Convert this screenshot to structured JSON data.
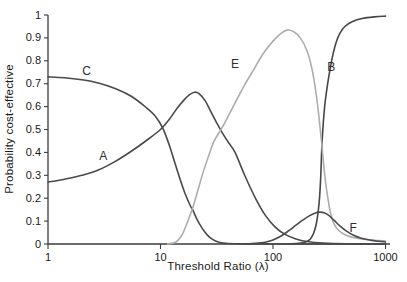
{
  "figure": {
    "background": "#ffffff",
    "axis_color": "#3d3d3d",
    "text_color": "#1a1a1a",
    "dark_curve_color": "#4a4a4a",
    "light_curve_color": "#adadad"
  },
  "chart_data": {
    "type": "line",
    "title": "",
    "xlabel": "Threshold Ratio (λ)",
    "ylabel": "Probability cost-effective",
    "x_scale": "log",
    "xlim": [
      1,
      1000
    ],
    "ylim": [
      0,
      1
    ],
    "grid": false,
    "legend": "inline letter labels on curves",
    "x_ticks": [
      {
        "value": 1,
        "label": "1"
      },
      {
        "value": 10,
        "label": "10"
      },
      {
        "value": 100,
        "label": "100"
      },
      {
        "value": 1000,
        "label": "1000"
      }
    ],
    "y_ticks": [
      {
        "value": 0.0,
        "label": "0"
      },
      {
        "value": 0.1,
        "label": "0.1"
      },
      {
        "value": 0.2,
        "label": "0.2"
      },
      {
        "value": 0.3,
        "label": "0.3"
      },
      {
        "value": 0.4,
        "label": "0.4"
      },
      {
        "value": 0.5,
        "label": "0.5"
      },
      {
        "value": 0.6,
        "label": "0.6"
      },
      {
        "value": 0.7,
        "label": "0.7"
      },
      {
        "value": 0.8,
        "label": "0.8"
      },
      {
        "value": 0.9,
        "label": "0.9"
      },
      {
        "value": 1.0,
        "label": "1"
      }
    ],
    "series": [
      {
        "name": "A",
        "color": "#4a4a4a",
        "label": "A",
        "label_pos": {
          "x": 3.1,
          "y": 0.385
        },
        "points": [
          [
            1,
            0.27
          ],
          [
            1.4,
            0.283
          ],
          [
            2,
            0.3
          ],
          [
            2.8,
            0.323
          ],
          [
            4,
            0.362
          ],
          [
            5.5,
            0.405
          ],
          [
            7.5,
            0.452
          ],
          [
            10,
            0.5
          ],
          [
            12,
            0.545
          ],
          [
            14,
            0.592
          ],
          [
            16,
            0.626
          ],
          [
            18,
            0.651
          ],
          [
            20,
            0.663
          ],
          [
            22,
            0.657
          ],
          [
            25,
            0.625
          ],
          [
            28,
            0.578
          ],
          [
            31.5,
            0.53
          ],
          [
            35,
            0.49
          ],
          [
            40,
            0.445
          ],
          [
            46,
            0.4
          ],
          [
            56,
            0.3
          ],
          [
            69,
            0.205
          ],
          [
            85,
            0.127
          ],
          [
            104,
            0.075
          ],
          [
            128,
            0.042
          ],
          [
            160,
            0.022
          ],
          [
            200,
            0.011
          ],
          [
            280,
            0.004
          ],
          [
            450,
            0.001
          ],
          [
            1000,
            0.0005
          ]
        ]
      },
      {
        "name": "B",
        "color": "#464646",
        "label": "B",
        "label_pos": {
          "x": 330,
          "y": 0.775
        },
        "points": [
          [
            140,
            0.0005
          ],
          [
            170,
            0.003
          ],
          [
            195,
            0.009
          ],
          [
            215,
            0.022
          ],
          [
            230,
            0.048
          ],
          [
            242,
            0.085
          ],
          [
            252,
            0.14
          ],
          [
            260,
            0.21
          ],
          [
            266,
            0.3
          ],
          [
            272,
            0.43
          ],
          [
            280,
            0.53
          ],
          [
            290,
            0.615
          ],
          [
            305,
            0.695
          ],
          [
            322,
            0.765
          ],
          [
            342,
            0.83
          ],
          [
            365,
            0.882
          ],
          [
            395,
            0.922
          ],
          [
            440,
            0.952
          ],
          [
            510,
            0.972
          ],
          [
            620,
            0.985
          ],
          [
            800,
            0.992
          ],
          [
            1000,
            0.995
          ]
        ]
      },
      {
        "name": "C",
        "color": "#4a4a4a",
        "label": "C",
        "label_pos": {
          "x": 2.2,
          "y": 0.757
        },
        "points": [
          [
            1,
            0.73
          ],
          [
            1.4,
            0.726
          ],
          [
            2,
            0.717
          ],
          [
            2.8,
            0.703
          ],
          [
            4,
            0.678
          ],
          [
            5.5,
            0.645
          ],
          [
            7.5,
            0.595
          ],
          [
            9,
            0.558
          ],
          [
            10.5,
            0.505
          ],
          [
            12,
            0.43
          ],
          [
            13.5,
            0.35
          ],
          [
            15,
            0.28
          ],
          [
            16.7,
            0.215
          ],
          [
            18.5,
            0.165
          ],
          [
            19.4,
            0.148
          ],
          [
            21,
            0.11
          ],
          [
            23.5,
            0.068
          ],
          [
            26,
            0.04
          ],
          [
            29,
            0.02
          ],
          [
            33,
            0.008
          ],
          [
            40,
            0.002
          ],
          [
            60,
            0.0005
          ],
          [
            200,
            0
          ],
          [
            1000,
            0
          ]
        ]
      },
      {
        "name": "E",
        "color": "#adadad",
        "label": "E",
        "label_pos": {
          "x": 46,
          "y": 0.785
        },
        "points": [
          [
            11.5,
            0
          ],
          [
            13,
            0.004
          ],
          [
            14,
            0.012
          ],
          [
            15,
            0.028
          ],
          [
            16,
            0.052
          ],
          [
            17.5,
            0.1
          ],
          [
            19.4,
            0.16
          ],
          [
            21.5,
            0.235
          ],
          [
            24,
            0.315
          ],
          [
            27,
            0.39
          ],
          [
            30,
            0.45
          ],
          [
            35,
            0.505
          ],
          [
            40,
            0.558
          ],
          [
            47,
            0.625
          ],
          [
            56,
            0.695
          ],
          [
            68,
            0.765
          ],
          [
            82,
            0.832
          ],
          [
            100,
            0.886
          ],
          [
            118,
            0.92
          ],
          [
            133,
            0.934
          ],
          [
            152,
            0.928
          ],
          [
            175,
            0.9
          ],
          [
            200,
            0.845
          ],
          [
            222,
            0.765
          ],
          [
            242,
            0.655
          ],
          [
            258,
            0.54
          ],
          [
            272,
            0.43
          ],
          [
            287,
            0.31
          ],
          [
            302,
            0.225
          ],
          [
            320,
            0.15
          ],
          [
            340,
            0.1
          ],
          [
            370,
            0.068
          ],
          [
            420,
            0.045
          ],
          [
            510,
            0.029
          ],
          [
            630,
            0.021
          ],
          [
            800,
            0.016
          ],
          [
            1000,
            0.013
          ]
        ]
      },
      {
        "name": "F",
        "color": "#4a4a4a",
        "label": "F",
        "label_pos": {
          "x": 515,
          "y": 0.068
        },
        "points": [
          [
            55,
            0
          ],
          [
            70,
            0.003
          ],
          [
            85,
            0.008
          ],
          [
            100,
            0.018
          ],
          [
            118,
            0.035
          ],
          [
            138,
            0.058
          ],
          [
            160,
            0.082
          ],
          [
            185,
            0.105
          ],
          [
            210,
            0.123
          ],
          [
            235,
            0.134
          ],
          [
            258,
            0.139
          ],
          [
            285,
            0.136
          ],
          [
            315,
            0.124
          ],
          [
            350,
            0.103
          ],
          [
            395,
            0.078
          ],
          [
            450,
            0.056
          ],
          [
            520,
            0.038
          ],
          [
            610,
            0.025
          ],
          [
            730,
            0.017
          ],
          [
            870,
            0.012
          ],
          [
            1000,
            0.009
          ]
        ]
      }
    ]
  }
}
